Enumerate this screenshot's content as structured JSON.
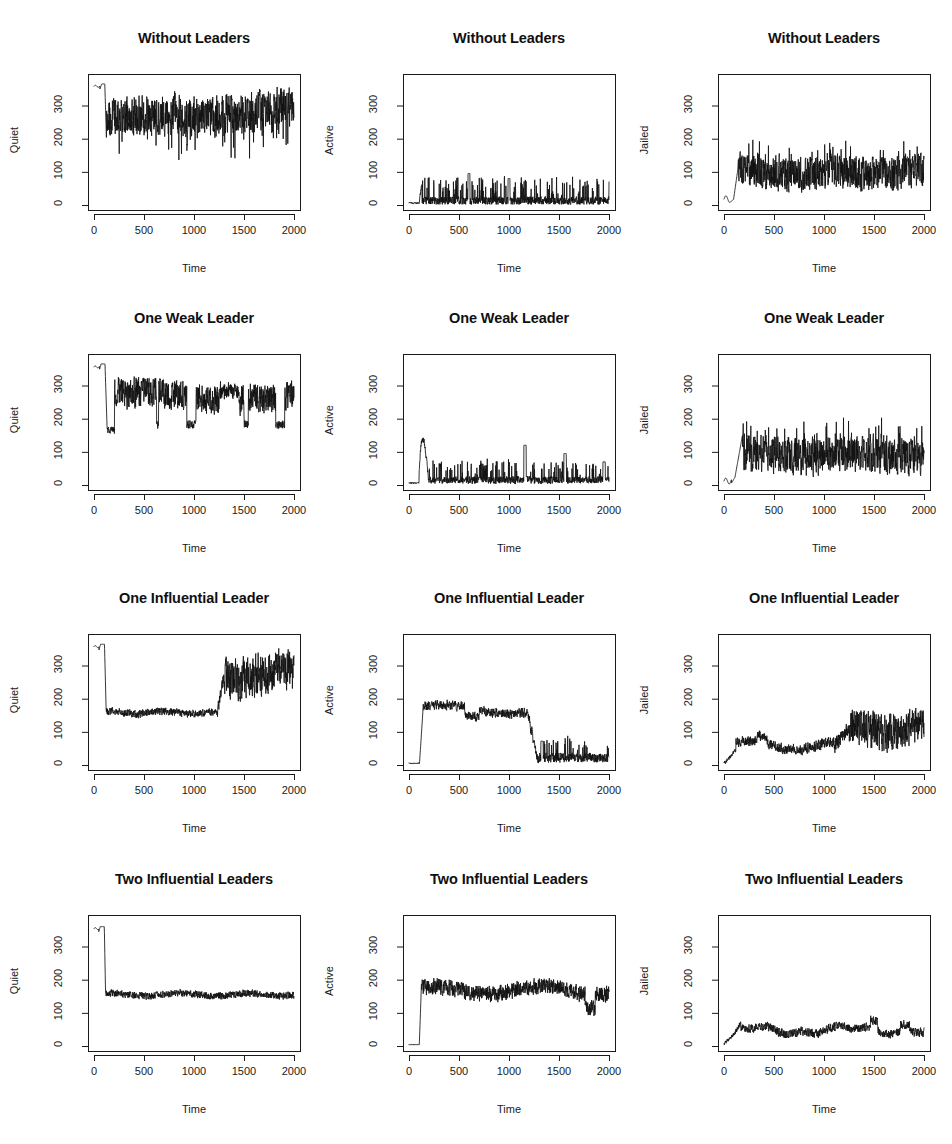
{
  "figure": {
    "background": "#ffffff",
    "line_color": "#121212",
    "axis_color": "#1a1a1a",
    "rows": 4,
    "cols": 3,
    "width": 952,
    "height": 1144
  },
  "top_fragment": "",
  "axes": {
    "xlabel": "Time",
    "xticks": [
      "0",
      "500",
      "1000",
      "1500",
      "2000"
    ],
    "xtick_values": [
      0,
      500,
      1000,
      1500,
      2000
    ],
    "yticks": [
      "0",
      "100",
      "200",
      "300"
    ],
    "ytick_values": [
      0,
      100,
      200,
      300
    ],
    "xlim": [
      -60,
      2060
    ],
    "ylim": [
      -15,
      395
    ]
  },
  "scenarios": [
    "Without Leaders",
    "One Weak Leader",
    "One Influential Leader",
    "Two Influential Leaders"
  ],
  "measures": [
    "Quiet",
    "Active",
    "Jailed"
  ],
  "chart_data": [
    {
      "id": "r0c0",
      "type": "line",
      "title": "Without Leaders",
      "xlabel": "Time",
      "ylabel": "Quiet",
      "xlim": [
        -60,
        2060
      ],
      "ylim": [
        -15,
        395
      ],
      "grid": false,
      "legend": null,
      "series": [
        {
          "name": "Quiet",
          "description": "Starts near 360, brief dip and rebound to ~365 around t=60, sharp drop at t~110 to ~200, then noisy oscillation with mean ~262 and spikes between 180 and 305 for the remainder.",
          "noise_mean": 262,
          "noise_amplitude": 48,
          "samples": [
            360,
            358,
            356,
            357,
            359,
            361,
            362,
            363,
            364,
            365,
            358,
            352,
            349,
            355,
            362,
            365,
            366,
            366,
            365,
            364,
            363,
            363,
            362,
            362,
            361,
            361,
            362,
            363,
            364,
            365,
            366,
            366,
            365,
            364,
            363,
            362,
            361,
            360,
            359,
            358,
            357,
            356,
            355,
            354,
            353,
            352,
            351,
            350,
            349,
            348,
            347,
            346,
            345,
            344,
            343,
            342,
            341,
            340,
            339,
            338,
            337,
            336,
            335,
            334,
            333,
            332,
            331,
            330,
            329,
            328,
            327,
            326,
            325,
            324,
            323,
            322,
            321,
            320,
            319,
            318,
            317,
            316,
            315,
            314,
            313,
            312,
            311,
            310,
            309,
            308,
            307,
            306,
            305,
            304,
            303,
            302,
            301,
            300,
            299,
            298,
            297,
            296,
            295,
            294,
            293,
            292,
            291,
            290,
            289,
            288,
            287,
            286,
            285,
            284,
            283,
            282,
            281,
            280,
            279,
            278,
            230,
            200,
            182,
            190,
            214,
            238,
            255,
            268,
            275,
            262,
            245,
            232,
            226,
            240,
            258,
            272,
            280,
            275,
            262,
            248,
            236,
            228,
            238,
            256,
            272,
            282,
            278,
            266,
            252,
            240,
            232,
            244,
            262,
            276,
            284,
            278,
            264,
            250,
            238,
            230,
            242,
            260,
            274,
            284,
            280,
            268,
            254,
            242,
            234,
            246,
            264,
            278,
            286,
            280,
            266,
            252,
            240,
            232,
            244,
            262,
            276,
            286,
            282,
            270,
            256,
            244,
            236,
            248,
            266,
            280,
            288,
            282,
            268,
            254,
            242,
            234,
            246,
            264,
            278,
            288,
            284,
            272,
            258,
            246,
            238,
            250,
            268,
            282,
            290,
            284,
            270,
            256,
            244,
            236,
            248,
            266,
            280,
            290,
            286,
            274,
            260,
            248,
            240,
            252,
            270,
            284,
            292,
            286,
            272,
            258,
            246,
            238,
            250,
            268,
            282,
            292,
            288,
            276,
            262,
            250,
            242,
            254,
            272,
            286,
            294,
            288,
            274,
            260,
            248,
            240,
            252,
            270,
            284,
            294,
            290,
            278,
            264,
            252,
            244,
            256,
            274,
            288,
            296,
            290,
            276,
            262,
            250,
            242,
            254,
            272,
            286,
            296,
            292,
            280,
            266,
            254,
            246,
            258,
            276,
            290,
            298,
            292,
            278,
            264,
            252,
            244,
            256,
            274,
            288,
            298,
            294,
            282,
            268,
            256,
            248,
            260,
            278,
            292,
            300,
            294,
            280,
            266,
            254,
            246,
            258,
            276,
            290,
            300,
            296,
            284,
            270,
            258,
            250,
            262,
            280,
            294,
            302,
            296,
            282,
            268,
            256,
            248,
            260,
            278,
            292,
            302,
            298,
            286,
            272,
            260,
            252,
            264,
            282,
            296,
            304,
            298,
            284,
            270,
            258,
            250,
            262,
            280,
            294,
            304,
            300,
            288,
            274,
            262,
            254,
            266,
            284,
            298,
            306,
            300,
            286,
            272,
            260,
            252
          ]
        }
      ]
    },
    {
      "id": "r0c1",
      "type": "line",
      "title": "Without Leaders",
      "xlabel": "Time",
      "ylabel": "Active",
      "xlim": [
        -60,
        2060
      ],
      "ylim": [
        -15,
        395
      ],
      "grid": false,
      "legend": null,
      "series": [
        {
          "name": "Active",
          "description": "Essentially zero until t~110, then a burst to ~65, followed by a continuous spiky low-level signal with baseline ~12 and frequent spikes reaching 40-70; largest spikes near t=600 (~95), t=1000 (~80).",
          "noise_mean": 14,
          "noise_amplitude": 30,
          "peak_values": [
            65,
            95,
            80,
            70
          ],
          "peak_times": [
            115,
            600,
            1000,
            1500
          ]
        }
      ]
    },
    {
      "id": "r0c2",
      "type": "line",
      "title": "Without Leaders",
      "xlabel": "Time",
      "ylabel": "Jailed",
      "xlim": [
        -60,
        2060
      ],
      "ylim": [
        -15,
        395
      ],
      "grid": false,
      "legend": null,
      "series": [
        {
          "name": "Jailed",
          "description": "Near 8-25 until t~100, sharp rise to ~110 at t~130, then steady noisy band oscillating mostly between 60 and 140 with mean ~98 for the remainder.",
          "noise_mean": 98,
          "noise_amplitude": 42
        }
      ]
    },
    {
      "id": "r1c0",
      "type": "line",
      "title": "One Weak Leader",
      "xlabel": "Time",
      "ylabel": "Quiet",
      "xlim": [
        -60,
        2060
      ],
      "ylim": [
        -15,
        395
      ],
      "grid": false,
      "legend": null,
      "series": [
        {
          "name": "Quiet",
          "description": "Starts ~358, small notch, holds ~365 to t~110, crashes to ~165 plateau until t~200, then recovers to a noisy band with mean ~265 punctuated by deep drops to 170-200 roughly every 60-100 steps; a flatter high stretch near t=1250-1450.",
          "noise_mean": 265,
          "noise_amplitude": 55,
          "plateau_value": 165,
          "plateau_range": [
            120,
            200
          ]
        }
      ]
    },
    {
      "id": "r1c1",
      "type": "line",
      "title": "One Weak Leader",
      "xlabel": "Time",
      "ylabel": "Active",
      "xlim": [
        -60,
        2060
      ],
      "ylim": [
        -15,
        395
      ],
      "grid": false,
      "legend": null,
      "series": [
        {
          "name": "Active",
          "description": "Flat near 5 until t~100, jumps to a rounded hump peaking ~135 around t=140-190, falls back to ~15 baseline with repeated spikes of 35-70 and three notable spikes: ~120 at t=1160, ~95 at t=1560, ~70 at t=1950.",
          "noise_mean": 16,
          "noise_amplitude": 28,
          "peak_values": [
            135,
            120,
            95,
            70
          ],
          "peak_times": [
            160,
            1160,
            1560,
            1950
          ]
        }
      ]
    },
    {
      "id": "r1c2",
      "type": "line",
      "title": "One Weak Leader",
      "xlabel": "Time",
      "ylabel": "Jailed",
      "xlim": [
        -60,
        2060
      ],
      "ylim": [
        -15,
        395
      ],
      "grid": false,
      "legend": null,
      "series": [
        {
          "name": "Jailed",
          "description": "Low (5-25) until t~110, rises steeply to a spike of ~150 at t~180, then a noisy band with mean ~92 oscillating between 50 and 150 across the rest of the run.",
          "noise_mean": 92,
          "noise_amplitude": 45
        }
      ]
    },
    {
      "id": "r2c0",
      "type": "line",
      "title": "One Influential Leader",
      "xlabel": "Time",
      "ylabel": "Quiet",
      "xlim": [
        -60,
        2060
      ],
      "ylim": [
        -15,
        395
      ],
      "grid": false,
      "legend": null,
      "series": [
        {
          "name": "Quiet",
          "description": "Starts ~358 with a notch, holds to t~105, crashes to a tight low-noise plateau at ~158 lasting until t~1230, then rises sharply to a noisy high band with mean ~272 (range 200-320) for t=1300-2000.",
          "noise_mean_low": 158,
          "noise_mean_high": 272,
          "regime_change_time": 1250
        }
      ]
    },
    {
      "id": "r2c1",
      "type": "line",
      "title": "One Influential Leader",
      "xlabel": "Time",
      "ylabel": "Active",
      "xlim": [
        -60,
        2060
      ],
      "ylim": [
        -15,
        395
      ],
      "grid": false,
      "legend": null,
      "series": [
        {
          "name": "Active",
          "description": "Near 5 until t~105, jumps to a broad plateau around 165-180 (peaks ~190 near t=520 and t=840), slight sag near t=620, then collapses between t=1180 and t=1280 to a low noisy band with mean ~22 and spikes to 60-75 for the remainder.",
          "plateau_value": 172,
          "post_collapse_mean": 22,
          "regime_change_time": 1230
        }
      ]
    },
    {
      "id": "r2c2",
      "type": "line",
      "title": "One Influential Leader",
      "xlabel": "Time",
      "ylabel": "Jailed",
      "xlim": [
        -60,
        2060
      ],
      "ylim": [
        -15,
        395
      ],
      "grid": false,
      "legend": null,
      "series": [
        {
          "name": "Jailed",
          "description": "Rises from ~5 to ~45 by t=120, slow rolling band 35-75 with a local hump ~78 around t=380, dips to ~45 near t=600-950, then climbs from t~1100 into a high noisy band with mean ~105 (range 60-150) through t=2000.",
          "mean_early": 52,
          "mean_late": 105,
          "regime_change_time": 1200
        }
      ]
    },
    {
      "id": "r3c0",
      "type": "line",
      "title": "Two Influential Leaders",
      "xlabel": "Time",
      "ylabel": "Quiet",
      "xlim": [
        -60,
        2060
      ],
      "ylim": [
        -15,
        395
      ],
      "grid": false,
      "legend": null,
      "series": [
        {
          "name": "Quiet",
          "description": "Starts ~355 with a small notch, holds to t~105, then drops vertically to a very stable low-noise band at ~155 (range 145-172) that persists unchanged through t=2000.",
          "plateau_value": 155,
          "plateau_noise": 12
        }
      ]
    },
    {
      "id": "r3c1",
      "type": "line",
      "title": "Two Influential Leaders",
      "xlabel": "Time",
      "ylabel": "Active",
      "xlim": [
        -60,
        2060
      ],
      "ylim": [
        -15,
        395
      ],
      "grid": false,
      "legend": null,
      "series": [
        {
          "name": "Active",
          "description": "Flat near 3 until t~105, jumps to a sustained noisy band with mean ~168 (range 135-205) across the whole run; a notable dip to ~120 around t=1800 then recovery to ~175.",
          "plateau_value": 168,
          "plateau_noise": 32,
          "dip_time": 1800,
          "dip_value": 120
        }
      ]
    },
    {
      "id": "r3c2",
      "type": "line",
      "title": "Two Influential Leaders",
      "xlabel": "Time",
      "ylabel": "Jailed",
      "xlim": [
        -60,
        2060
      ],
      "ylim": [
        -15,
        395
      ],
      "grid": false,
      "legend": null,
      "series": [
        {
          "name": "Jailed",
          "description": "Rises from ~5 at t=0 to a band with mean ~48 by t=130 (local peak ~72 at t=150), then gentle rolling oscillation between 30 and 65 with humps ~78 at t=1500 and ~72 at t=1800, ending near 48.",
          "mean": 48,
          "noise_amplitude": 22,
          "peak_values": [
            72,
            78,
            72
          ],
          "peak_times": [
            150,
            1500,
            1800
          ]
        }
      ]
    }
  ]
}
